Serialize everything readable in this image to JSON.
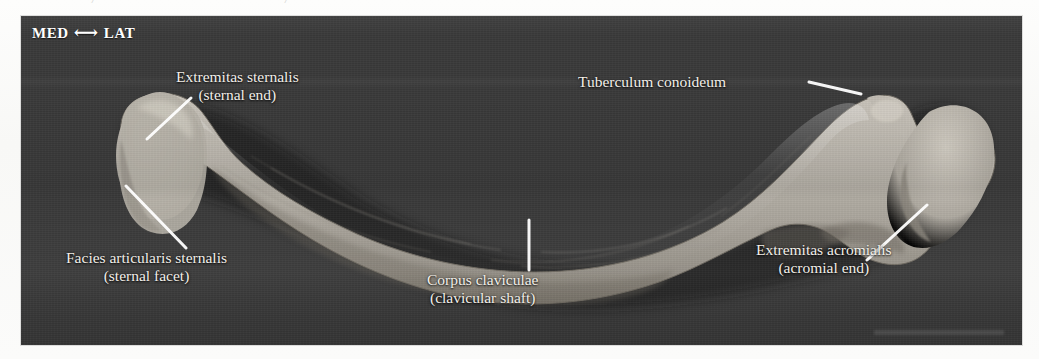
{
  "figure": {
    "view": "superior view of right clavicle",
    "plate_background_color": "#3a3a3a",
    "bone_color": "#b0aba2",
    "label_text_color": "#f2efe9",
    "leader_line_color": "#ffffff"
  },
  "orientation_key": {
    "medial_label": "MED",
    "arrow_glyph": "⟷",
    "lateral_label": "LAT"
  },
  "ghost_text": {
    "fragment_left": "/",
    "fragment_mid": "/"
  },
  "labels": [
    {
      "id": "sternal-end",
      "latin": "Extremitas sternalis",
      "english": "(sternal end)"
    },
    {
      "id": "sternal-facet",
      "latin": "Facies articularis sternalis",
      "english": "(sternal facet)"
    },
    {
      "id": "shaft",
      "latin": "Corpus claviculae",
      "english": "(clavicular shaft)"
    },
    {
      "id": "conoid-tubercle",
      "latin": "Tuberculum conoideum",
      "english": ""
    },
    {
      "id": "acromial-end",
      "latin": "Extremitas acromialis",
      "english": "(acromial end)"
    }
  ]
}
